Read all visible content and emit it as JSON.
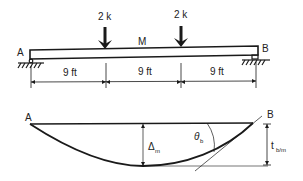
{
  "beam": {
    "support_left_label": "A",
    "support_right_label": "B",
    "midpoint_label": "M",
    "loads": [
      {
        "label": "2 k",
        "x": 105
      },
      {
        "label": "2 k",
        "x": 181
      }
    ],
    "spans": [
      {
        "label": "9 ft"
      },
      {
        "label": "9 ft"
      },
      {
        "label": "9 ft"
      }
    ]
  },
  "deflection": {
    "left_label": "A",
    "right_label": "B",
    "max_deflection_symbol": "Δ",
    "max_deflection_sub": "m",
    "slope_symbol": "θ",
    "slope_sub": "b",
    "tangent_deviation_symbol": "t",
    "tangent_deviation_sub": "b/m"
  },
  "colors": {
    "line": "#1a1a1a",
    "background": "#ffffff"
  }
}
